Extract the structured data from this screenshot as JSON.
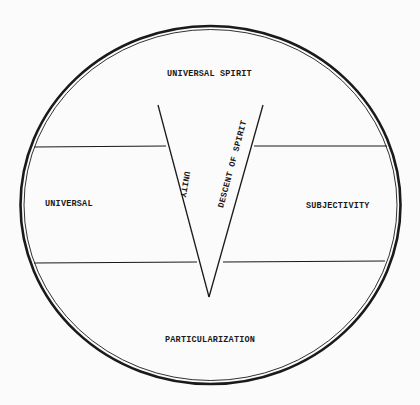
{
  "diagram": {
    "regions": {
      "top": "UNIVERSAL SPIRIT",
      "left": "UNIVERSAL",
      "right": "SUBJECTIVITY",
      "bottom": "PARTICULARIZATION"
    },
    "arms": {
      "left": "UNITY",
      "right": "DESCENT OF SPIRIT"
    },
    "colors": {
      "ink": "#1a1a1a",
      "paper": "#fbfbfb"
    }
  }
}
